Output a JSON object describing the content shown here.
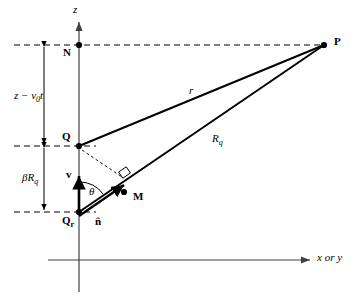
{
  "figure": {
    "axes": {
      "vertical_label": "z",
      "horizontal_label": "x or y"
    },
    "points": {
      "N": "N",
      "Q": "Q",
      "Qr": "Q",
      "Qr_sub": "r",
      "M": "M",
      "P": "P"
    },
    "segments": {
      "r": "r",
      "Rq": "R",
      "Rq_sub": "q"
    },
    "dimensions": {
      "upper": "z − v",
      "upper_sub": "0",
      "upper_tail": "t",
      "lower": "βR",
      "lower_sub": "q"
    },
    "vectors": {
      "velocity": "v",
      "normal": "n̂"
    },
    "angle": "θ",
    "colors": {
      "stroke": "#000000",
      "axis": "#404040",
      "dash": "#000000",
      "background": "#ffffff"
    }
  }
}
